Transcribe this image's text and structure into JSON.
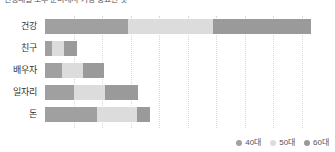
{
  "title": "연령대별 노후 준비에서 가장 중요한 것",
  "chart_data": {
    "type": "bar",
    "orientation": "horizontal",
    "stacked": true,
    "title": "연령대별 노후 준비에서 가장 중요한 것",
    "xlabel": "",
    "ylabel": "",
    "categories": [
      "건강",
      "친구",
      "배우자",
      "일자리",
      "돈"
    ],
    "series": [
      {
        "name": "40대",
        "color": "#a0a0a0",
        "values": [
          87,
          7,
          18,
          31,
          55
        ]
      },
      {
        "name": "50대",
        "color": "#dcdcdc",
        "values": [
          90,
          13,
          22,
          32,
          42
        ]
      },
      {
        "name": "60대",
        "color": "#9a9a9a",
        "values": [
          103,
          14,
          22,
          35,
          14
        ]
      }
    ],
    "xlim": [
      0,
      300
    ],
    "gridlines": [
      30,
      60,
      90,
      120,
      150,
      180,
      210,
      240,
      270
    ],
    "grid": true,
    "legend_position": "bottom-right"
  },
  "legend": {
    "items": [
      {
        "label": "40대",
        "color": "#a0a0a0"
      },
      {
        "label": "50대",
        "color": "#dcdcdc"
      },
      {
        "label": "60대",
        "color": "#9a9a9a"
      }
    ]
  }
}
